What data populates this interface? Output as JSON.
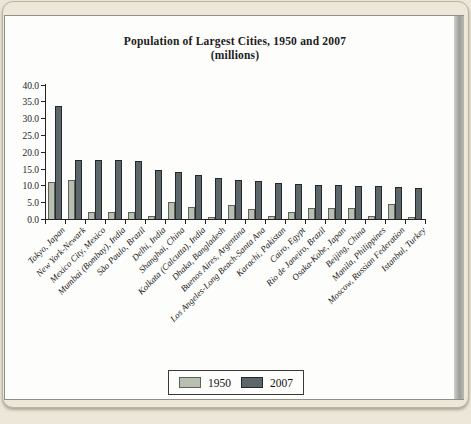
{
  "chart_data": {
    "type": "bar",
    "title": "Population of Largest Cities, 1950 and 2007",
    "subtitle": "(millions)",
    "categories": [
      "Tokyo, Japan",
      "New York-Newark",
      "Mexico City, Mexico",
      "Mumbai (Bombay), India",
      "São Paulo, Brazil",
      "Delhi, India",
      "Shanghai, China",
      "Kolkata (Calcutta), India",
      "Dhaka, Bangladesh",
      "Buenos Aires, Argentina",
      "Los Angeles-Long Beach-Santa Ana",
      "Karachi, Pakistan",
      "Cairo, Egypt",
      "Rio de Janeiro, Brazil",
      "Osaka-Kobe, Japan",
      "Beijing, China",
      "Manila, Philippines",
      "Moscow, Russian Federation",
      "Istanbul, Turkey"
    ],
    "series": [
      {
        "name": "1950",
        "color": "#b7bfb1",
        "values": [
          11.0,
          11.5,
          2.2,
          2.2,
          2.0,
          1.0,
          5.0,
          3.6,
          0.7,
          4.2,
          3.0,
          0.8,
          2.2,
          3.2,
          3.3,
          3.4,
          0.9,
          4.4,
          0.5
        ]
      },
      {
        "name": "2007",
        "color": "#5d6769",
        "values": [
          33.5,
          17.5,
          17.5,
          17.5,
          17.3,
          14.7,
          14.0,
          13.2,
          12.2,
          11.6,
          11.2,
          10.8,
          10.5,
          10.2,
          10.0,
          9.9,
          9.7,
          9.5,
          9.1
        ]
      }
    ],
    "ylim": [
      0,
      40
    ],
    "ytick_step": 5,
    "ytick_labels": [
      "40.0",
      "35.0",
      "30.0",
      "25.0",
      "20.0",
      "15.0",
      "10.0",
      "5.0",
      "0.0"
    ],
    "grid": false,
    "legend_position": "bottom",
    "xlabel": "",
    "ylabel": ""
  }
}
